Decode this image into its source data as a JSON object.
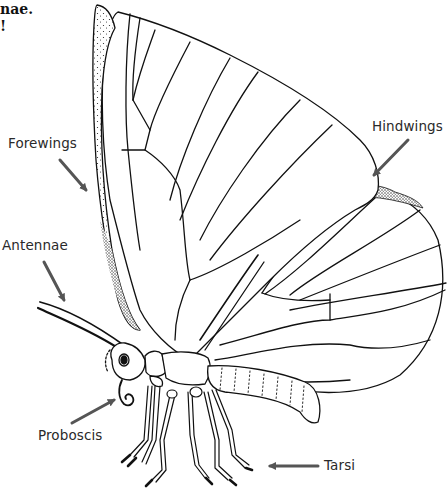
{
  "diagram": {
    "top_text_fragments": [
      "nae.",
      "!"
    ],
    "labels": [
      {
        "id": "forewings",
        "text": "Forewings"
      },
      {
        "id": "hindwings",
        "text": "Hindwings"
      },
      {
        "id": "antennae",
        "text": "Antennae"
      },
      {
        "id": "proboscis",
        "text": "Proboscis"
      },
      {
        "id": "tarsi",
        "text": "Tarsi"
      }
    ],
    "colors": {
      "line": "#111111",
      "arrow": "#555555",
      "label_text": "#2a2a2a",
      "background": "#ffffff"
    }
  }
}
